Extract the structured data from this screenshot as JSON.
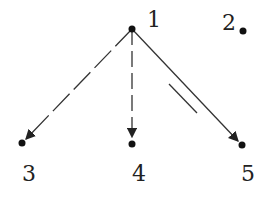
{
  "diagram": {
    "type": "directed-graph",
    "nodes": [
      {
        "id": "1",
        "label": "1",
        "x": 132,
        "y": 29,
        "label_x": 147,
        "label_y": 27
      },
      {
        "id": "2",
        "label": "2",
        "x": 243,
        "y": 31,
        "label_x": 219,
        "label_y": 27
      },
      {
        "id": "3",
        "label": "3",
        "x": 22,
        "y": 143,
        "label_x": 22,
        "label_y": 181
      },
      {
        "id": "4",
        "label": "4",
        "x": 132,
        "y": 143,
        "label_x": 132,
        "label_y": 181
      },
      {
        "id": "5",
        "label": "5",
        "x": 242,
        "y": 145,
        "label_x": 242,
        "label_y": 181
      }
    ],
    "edges": [
      {
        "from": "1",
        "to": "3",
        "style": "dashed-long"
      },
      {
        "from": "1",
        "to": "4",
        "style": "dashed"
      },
      {
        "from": "1",
        "to": "5",
        "style": "solid",
        "annotation": "parallel-double-mark"
      }
    ],
    "colors": {
      "stroke": "#333333",
      "node": "#111111"
    }
  }
}
